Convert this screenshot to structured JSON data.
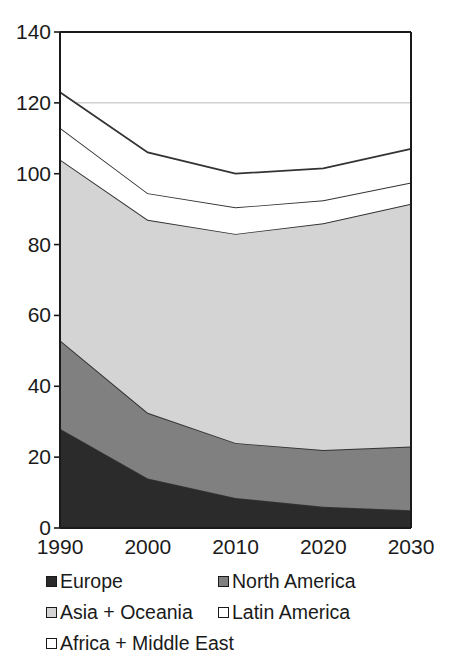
{
  "chart_data": {
    "type": "area",
    "stacked": true,
    "title": "",
    "xlabel": "",
    "ylabel": "",
    "categories": [
      "1990",
      "2000",
      "2010",
      "2020",
      "2030"
    ],
    "x": [
      1990,
      2000,
      2010,
      2020,
      2030
    ],
    "ylim": [
      0,
      140
    ],
    "xlim": [
      1990,
      2030
    ],
    "yticks": [
      "0",
      "20",
      "40",
      "60",
      "80",
      "100",
      "120",
      "140"
    ],
    "ytick_values": [
      0,
      20,
      40,
      60,
      80,
      100,
      120,
      140
    ],
    "grid": "horizontal-faint-at-120",
    "gridlines": [
      120
    ],
    "legend_position": "below-plot",
    "series": [
      {
        "name": "Europe",
        "color": "#2b2b2b",
        "values": [
          28,
          14,
          8.5,
          6,
          5
        ]
      },
      {
        "name": "North America",
        "color": "#808080",
        "values": [
          25,
          18.5,
          15.5,
          16,
          18
        ]
      },
      {
        "name": "Asia + Oceania",
        "color": "#d4d4d4",
        "values": [
          51,
          54.5,
          59,
          64,
          68.5
        ]
      },
      {
        "name": "Latin America",
        "color": "#ffffff",
        "values": [
          9,
          7.5,
          7.5,
          6.5,
          6
        ]
      },
      {
        "name": "Africa + Middle East",
        "color": "#ffffff",
        "values": [
          10,
          11.5,
          9.5,
          9,
          9.5
        ]
      }
    ],
    "cumulative_tops": {
      "Europe": [
        28,
        14,
        8.5,
        6,
        5
      ],
      "North America": [
        53,
        32.5,
        24,
        22,
        23
      ],
      "Asia + Oceania": [
        104,
        87,
        83,
        86,
        91.5
      ],
      "Latin America": [
        113,
        94.5,
        90.5,
        92.5,
        97.5
      ],
      "Africa + Middle East": [
        123,
        106,
        100,
        101.5,
        107
      ]
    },
    "totals": [
      123,
      106,
      100,
      101.5,
      107
    ]
  },
  "legend": {
    "items": [
      {
        "label": "Europe",
        "color": "#2b2b2b"
      },
      {
        "label": "North America",
        "color": "#808080"
      },
      {
        "label": "Asia + Oceania",
        "color": "#d4d4d4"
      },
      {
        "label": "Latin America",
        "color": "#ffffff"
      },
      {
        "label": "Africa + Middle East",
        "color": "#ffffff"
      }
    ]
  },
  "axes": {
    "y_labels": [
      "140",
      "120",
      "100",
      "80",
      "60",
      "40",
      "20",
      "0"
    ],
    "x_labels": [
      "1990",
      "2000",
      "2010",
      "2020",
      "2030"
    ]
  }
}
